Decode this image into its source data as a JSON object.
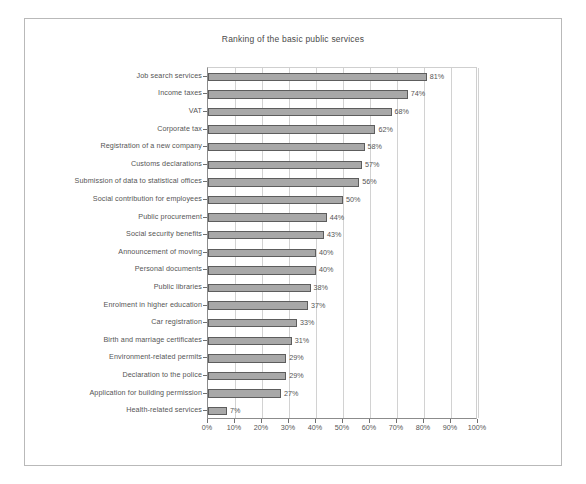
{
  "chart_data": {
    "type": "bar",
    "orientation": "horizontal",
    "title": "Ranking of the basic public services",
    "xlabel": "",
    "ylabel": "",
    "xlim": [
      0,
      100
    ],
    "xtick_labels": [
      "0%",
      "10%",
      "20%",
      "30%",
      "40%",
      "50%",
      "60%",
      "70%",
      "80%",
      "90%",
      "100%"
    ],
    "xticks": [
      0,
      10,
      20,
      30,
      40,
      50,
      60,
      70,
      80,
      90,
      100
    ],
    "grid": true,
    "legend": false,
    "bar_color": "#a8a8a8",
    "bar_border_color": "#5d5d5d",
    "categories": [
      "Job search services",
      "Income taxes",
      "VAT",
      "Corporate tax",
      "Registration of a new company",
      "Customs declarations",
      "Submission of data to statistical offices",
      "Social contribution for employees",
      "Public procurement",
      "Social security benefits",
      "Announcement of moving",
      "Personal documents",
      "Public libraries",
      "Enrolment in higher education",
      "Car registration",
      "Birth and marriage certificates",
      "Environment-related permits",
      "Declaration to the police",
      "Application for building permission",
      "Health-related services"
    ],
    "values": [
      81,
      74,
      68,
      62,
      58,
      57,
      56,
      50,
      44,
      43,
      40,
      40,
      38,
      37,
      33,
      31,
      29,
      29,
      27,
      7
    ],
    "value_labels": [
      "81%",
      "74%",
      "68%",
      "62%",
      "58%",
      "57%",
      "56%",
      "50%",
      "44%",
      "43%",
      "40%",
      "40%",
      "38%",
      "37%",
      "33%",
      "31%",
      "29%",
      "29%",
      "27%",
      "7%"
    ]
  }
}
